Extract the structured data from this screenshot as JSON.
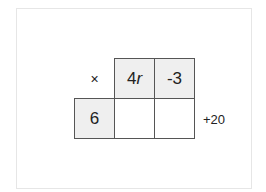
{
  "diagram": {
    "operator": "×",
    "column_headers": [
      {
        "coefficient": "4",
        "variable": "r"
      },
      {
        "value": "-3"
      }
    ],
    "row_headers": [
      "6"
    ],
    "products": [
      [
        "",
        ""
      ]
    ],
    "side_term": "+20"
  },
  "colors": {
    "header_fill": "#efefef",
    "cell_fill": "#ffffff",
    "grid_line": "#555555",
    "frame_border": "#e6e6e6"
  }
}
